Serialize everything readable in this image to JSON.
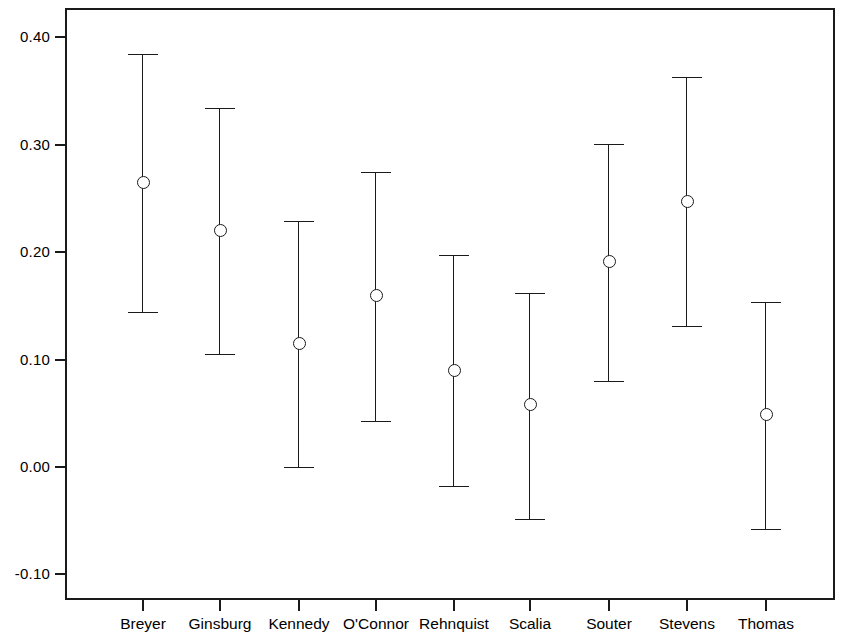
{
  "chart_data": {
    "type": "scatter",
    "title": "",
    "subtitle": "",
    "xlabel": "",
    "ylabel": "",
    "categories": [
      "Breyer",
      "Ginsburg",
      "Kennedy",
      "O'Connor",
      "Rehnquist",
      "Scalia",
      "Souter",
      "Stevens",
      "Thomas"
    ],
    "yticks": [
      0.4,
      0.3,
      0.2,
      0.1,
      0.0,
      -0.1
    ],
    "ytick_labels": [
      "0.40",
      "0.30",
      "0.20",
      "0.10",
      "0.00",
      "-0.10"
    ],
    "ylim": [
      -0.145,
      0.4065
    ],
    "grid": false,
    "legend": null,
    "marker": "open-circle",
    "errorbar_style": "capped-vertical",
    "series": [
      {
        "name": "estimate",
        "values": [
          0.265,
          0.22,
          0.115,
          0.16,
          0.09,
          0.058,
          0.191,
          0.247,
          0.049
        ],
        "ci_lower": [
          0.144,
          0.105,
          0.0,
          0.043,
          -0.018,
          -0.048,
          0.08,
          0.131,
          -0.058
        ],
        "ci_upper": [
          0.385,
          0.334,
          0.229,
          0.275,
          0.197,
          0.162,
          0.301,
          0.363,
          0.154
        ]
      }
    ],
    "points": [
      {
        "label": "Breyer",
        "value": 0.265,
        "low": 0.144,
        "high": 0.385
      },
      {
        "label": "Ginsburg",
        "value": 0.22,
        "low": 0.105,
        "high": 0.334
      },
      {
        "label": "Kennedy",
        "value": 0.115,
        "low": 0.0,
        "high": 0.229
      },
      {
        "label": "O'Connor",
        "value": 0.16,
        "low": 0.043,
        "high": 0.275
      },
      {
        "label": "Rehnquist",
        "value": 0.09,
        "low": -0.018,
        "high": 0.197
      },
      {
        "label": "Scalia",
        "value": 0.058,
        "low": -0.048,
        "high": 0.162
      },
      {
        "label": "Souter",
        "value": 0.191,
        "low": 0.08,
        "high": 0.301
      },
      {
        "label": "Stevens",
        "value": 0.247,
        "low": 0.131,
        "high": 0.363
      },
      {
        "label": "Thomas",
        "value": 0.049,
        "low": -0.058,
        "high": 0.154
      }
    ],
    "colors": {
      "axis": "#1a1a1a",
      "marker_edge": "#1a1a1a",
      "marker_fill": "#ffffff",
      "errorbar": "#1a1a1a",
      "background": "#ffffff"
    }
  }
}
